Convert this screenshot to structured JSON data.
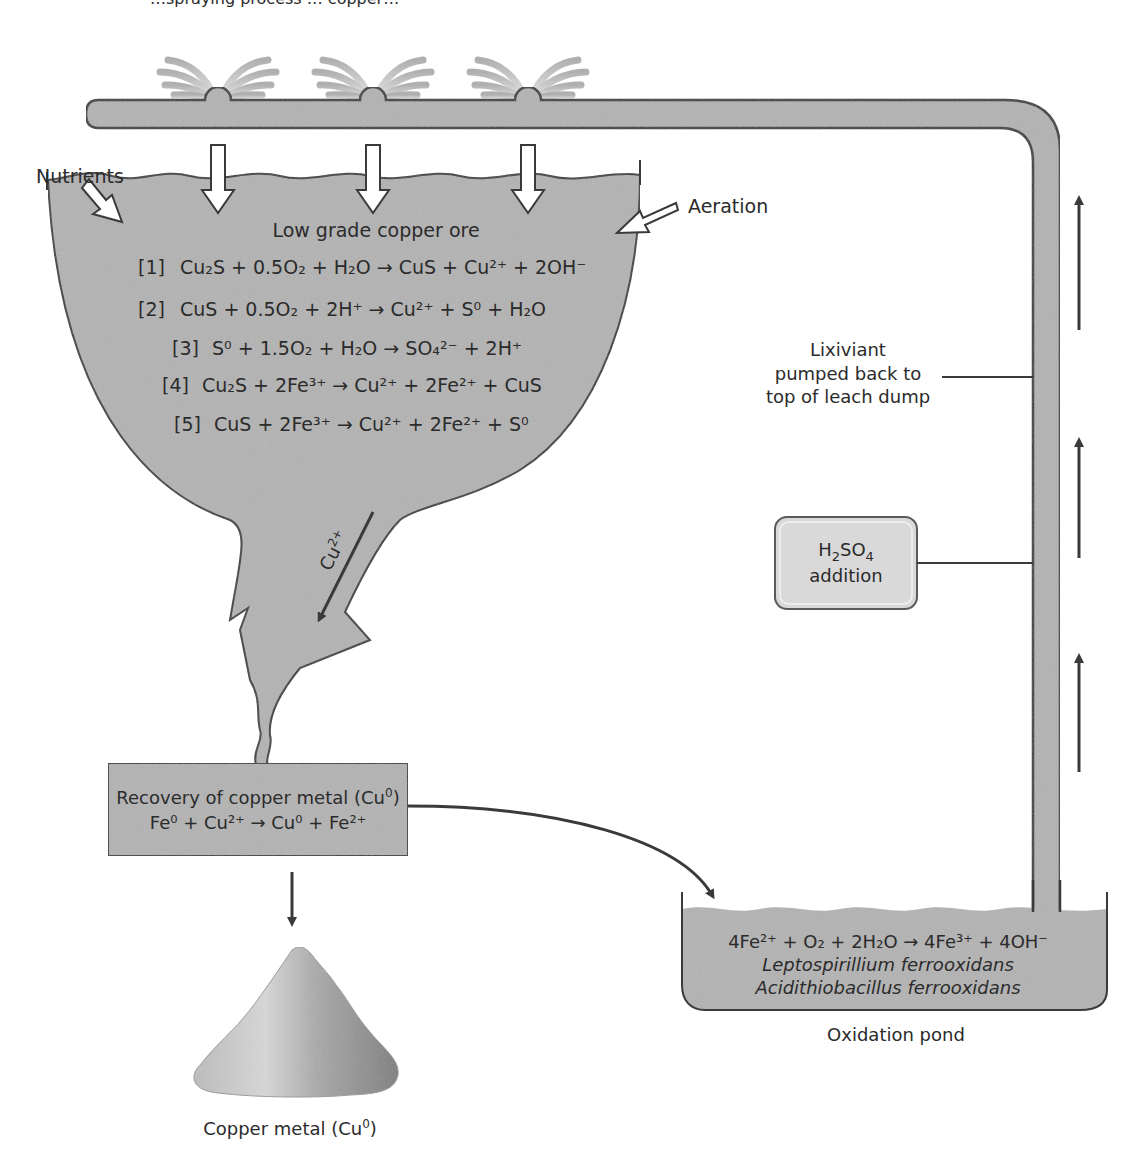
{
  "caption_fragment": "…spraying process … copper…",
  "colors": {
    "fill_gray": "#b3b3b3",
    "outline": "#3a3a3a",
    "acid_box": "#d9d9d9",
    "pile_light": "#d6d6d6",
    "pile_dark": "#8a8a8a"
  },
  "labels": {
    "nutrients": "Nutrients",
    "aeration": "Aeration",
    "ore_title": "Low grade copper ore",
    "lixiviant_line1": "Lixiviant",
    "lixiviant_line2": "pumped back to",
    "lixiviant_line3": "top of leach dump",
    "acid_line1_pre": "H",
    "acid_line1_sub1": "2",
    "acid_line1_mid": "SO",
    "acid_line1_sub2": "4",
    "acid_line2": "addition",
    "cu_flow_base": "Cu",
    "cu_flow_sup": "2+",
    "recovery_title_pre": "Recovery of copper metal (Cu",
    "recovery_title_sup": "0",
    "recovery_title_post": ")",
    "copper_metal_pre": "Copper metal (Cu",
    "copper_metal_sup": "0",
    "copper_metal_post": ")",
    "oxidation_pond": "Oxidation pond",
    "organism1": "Leptospirillium ferrooxidans",
    "organism2": "Acidithiobacillus ferrooxidans"
  },
  "reactions": [
    {
      "id": "[1]",
      "text": "Cu₂S + 0.5O₂ + H₂O → CuS + Cu²⁺  + 2OH⁻"
    },
    {
      "id": "[2]",
      "text": "CuS + 0.5O₂ + 2H⁺ → Cu²⁺ + S⁰ + H₂O"
    },
    {
      "id": "[3]",
      "text": "S⁰ + 1.5O₂ + H₂O → SO₄²⁻ + 2H⁺"
    },
    {
      "id": "[4]",
      "text": "Cu₂S + 2Fe³⁺ →  Cu²⁺ + 2Fe²⁺ + CuS"
    },
    {
      "id": "[5]",
      "text": "CuS + 2Fe³⁺ →  Cu²⁺ + 2Fe²⁺ + S⁰"
    }
  ],
  "recovery_reaction": "Fe⁰ + Cu²⁺ → Cu⁰ + Fe²⁺",
  "pond_reaction": "4Fe²⁺ + O₂ + 2H₂O → 4Fe³⁺ + 4OH⁻",
  "sprinklers": [
    {
      "id": "sprinkler-1",
      "x": 218
    },
    {
      "id": "sprinkler-2",
      "x": 373
    },
    {
      "id": "sprinkler-3",
      "x": 528
    }
  ]
}
